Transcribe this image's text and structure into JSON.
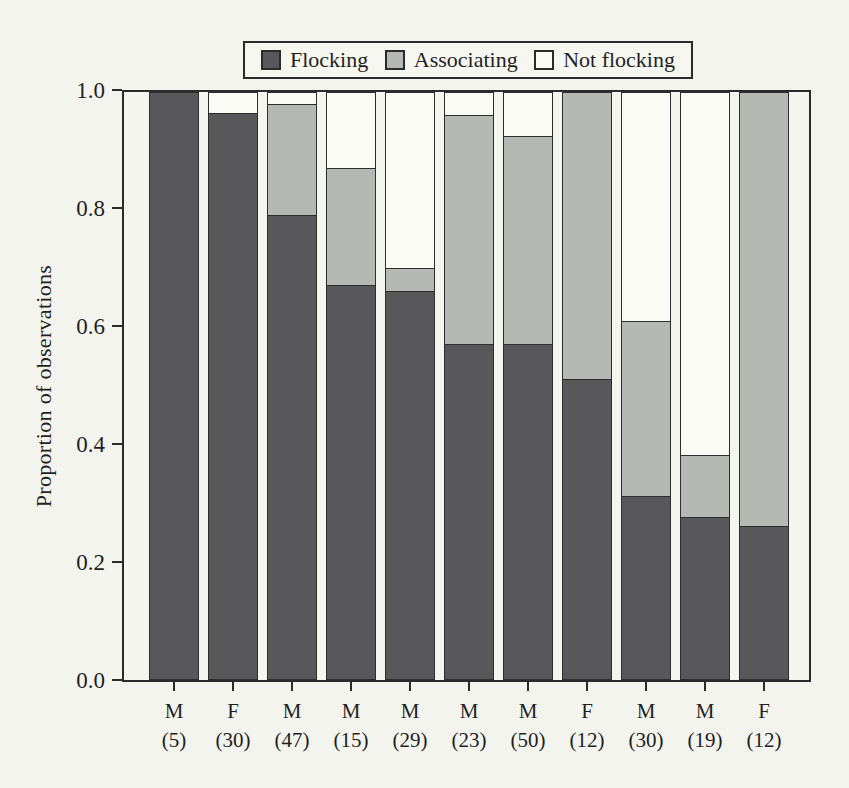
{
  "figure": {
    "kind": "scanned-book-figure",
    "background_color": "#f4f4ef",
    "frame_color": "#2b2b2b"
  },
  "chart_data": {
    "type": "bar",
    "stacked": true,
    "title": "",
    "ylabel": "Proportion of observations",
    "xlabel": "",
    "ylim": [
      0,
      1
    ],
    "yticks": [
      "1.0",
      "0.8",
      "0.6",
      "0.4",
      "0.2",
      "0.0"
    ],
    "ytick_values": [
      1.0,
      0.8,
      0.6,
      0.4,
      0.2,
      0.0
    ],
    "grid": false,
    "legend_position": "top",
    "categories": [
      "M",
      "F",
      "M",
      "M",
      "M",
      "M",
      "M",
      "F",
      "M",
      "M",
      "F"
    ],
    "counts": [
      "(5)",
      "(30)",
      "(47)",
      "(15)",
      "(29)",
      "(23)",
      "(50)",
      "(12)",
      "(30)",
      "(19)",
      "(12)"
    ],
    "series": [
      {
        "name": "Flocking",
        "color": "#58585a",
        "values": [
          1.0,
          0.965,
          0.79,
          0.67,
          0.66,
          0.57,
          0.57,
          0.51,
          0.31,
          0.275,
          0.26
        ]
      },
      {
        "name": "Associating",
        "color": "#b6b8b4",
        "values": [
          0,
          0,
          0.19,
          0.2,
          0.04,
          0.39,
          0.355,
          0.49,
          0.3,
          0.105,
          0.74
        ]
      },
      {
        "name": "Not flocking",
        "color": "#fbfbf6",
        "values": [
          0,
          0.035,
          0.02,
          0.13,
          0.3,
          0.04,
          0.075,
          0,
          0.39,
          0.62,
          0
        ]
      }
    ]
  }
}
